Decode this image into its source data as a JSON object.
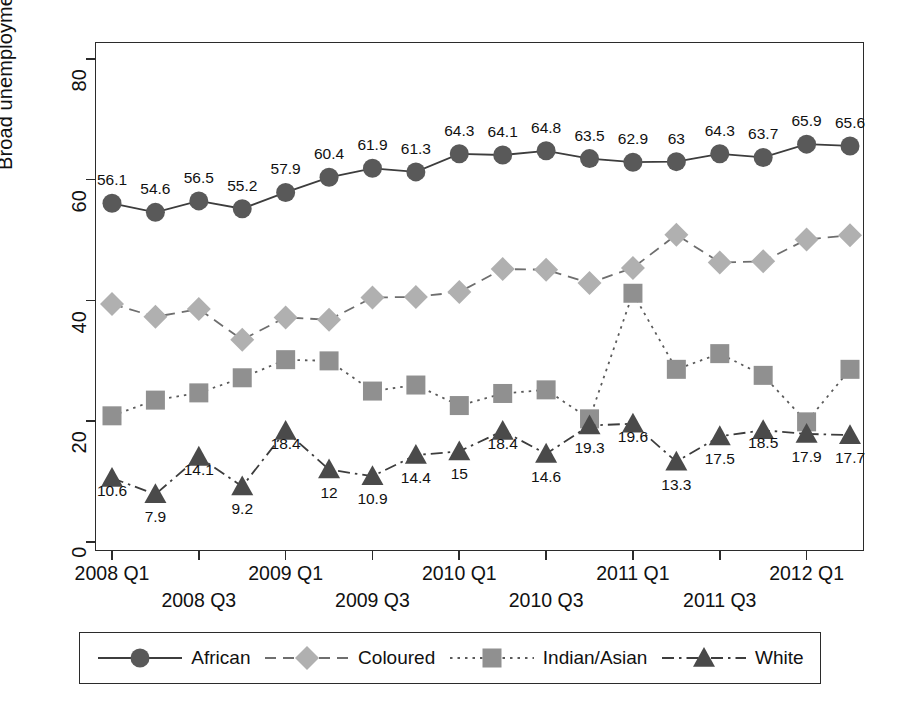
{
  "chart_data": {
    "type": "line",
    "title": "",
    "xlabel": "",
    "ylabel": "Broad unemployment rate (%)",
    "ylim": [
      0,
      85
    ],
    "yticks": [
      0,
      20,
      40,
      60,
      80
    ],
    "grid": false,
    "legend_position": "bottom",
    "x": [
      "2008 Q1",
      "2008 Q2",
      "2008 Q3",
      "2008 Q4",
      "2009 Q1",
      "2009 Q2",
      "2009 Q3",
      "2009 Q4",
      "2010 Q1",
      "2010 Q2",
      "2010 Q3",
      "2010 Q4",
      "2011 Q1",
      "2011 Q2",
      "2011 Q3",
      "2011 Q4",
      "2012 Q1",
      "2012 Q2"
    ],
    "xtick_labels_row1": [
      "2008 Q1",
      "2009 Q1",
      "2010 Q1",
      "2011 Q1",
      "2012 Q1"
    ],
    "xtick_labels_row2": [
      "2008 Q3",
      "2009 Q3",
      "2010 Q3",
      "2011 Q3"
    ],
    "xtick_labels": [
      "2008 Q1",
      "2008 Q3",
      "2009 Q1",
      "2009 Q3",
      "2010 Q1",
      "2010 Q3",
      "2011 Q1",
      "2011 Q3",
      "2012 Q1"
    ],
    "series": [
      {
        "name": "African",
        "marker": "circle",
        "linestyle": "solid",
        "color": "#595959",
        "line_color": "#3d3d3d",
        "values": [
          56.1,
          54.6,
          56.5,
          55.2,
          57.9,
          60.4,
          61.9,
          61.3,
          64.3,
          64.1,
          64.8,
          63.5,
          62.9,
          63,
          64.3,
          63.7,
          65.9,
          65.6
        ],
        "labels": [
          "56.1",
          "54.6",
          "56.5",
          "55.2",
          "57.9",
          "60.4",
          "61.9",
          "61.3",
          "64.3",
          "64.1",
          "64.8",
          "63.5",
          "62.9",
          "63",
          "64.3",
          "63.7",
          "65.9",
          "65.6"
        ],
        "labels_shown": true
      },
      {
        "name": "Coloured",
        "marker": "diamond",
        "linestyle": "dashed",
        "color": "#b0b0b0",
        "line_color": "#6e6e6e",
        "values": [
          39.4,
          37.3,
          38.6,
          33.5,
          37.2,
          36.8,
          40.5,
          40.6,
          41.4,
          45.2,
          45.1,
          42.9,
          45.4,
          50.9,
          46.3,
          46.5,
          50.1,
          50.8
        ],
        "labels_shown": false
      },
      {
        "name": "Indian/Asian",
        "marker": "square",
        "linestyle": "dotted",
        "color": "#909090",
        "line_color": "#5a5a5a",
        "values": [
          20.9,
          23.5,
          24.7,
          27.2,
          30.2,
          30.0,
          25.0,
          26.0,
          22.6,
          24.6,
          25.2,
          20.4,
          41.2,
          28.6,
          31.2,
          27.6,
          19.9,
          28.6
        ],
        "labels_shown": false
      },
      {
        "name": "White",
        "marker": "triangle",
        "linestyle": "dashdot",
        "color": "#4a4a4a",
        "line_color": "#3d3d3d",
        "values": [
          10.6,
          7.9,
          14.1,
          9.2,
          18.4,
          12,
          10.9,
          14.4,
          15,
          18.4,
          14.6,
          19.3,
          19.6,
          13.3,
          17.5,
          18.5,
          17.9,
          17.7
        ],
        "labels": [
          "10.6",
          "7.9",
          "14.1",
          "9.2",
          "18.4",
          "12",
          "10.9",
          "14.4",
          "15",
          "18.4",
          "14.6",
          "19.3",
          "19.6",
          "13.3",
          "17.5",
          "18.5",
          "17.9",
          "17.7"
        ],
        "labels_shown": true
      }
    ]
  },
  "legend": {
    "entries": [
      {
        "label": "African"
      },
      {
        "label": "Coloured"
      },
      {
        "label": "Indian/Asian"
      },
      {
        "label": "White"
      }
    ]
  }
}
